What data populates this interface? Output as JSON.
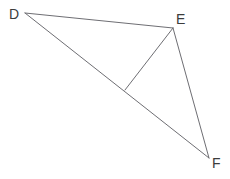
{
  "figure": {
    "background_color": "#ffffff",
    "width": 230,
    "height": 179,
    "stroke_color": "#6e6e73",
    "stroke_width": 1,
    "label_color": "#3c3c3c",
    "vertices": [
      {
        "id": "D",
        "label": "D",
        "x": 25,
        "y": 13,
        "label_x": 9,
        "label_y": 7
      },
      {
        "id": "E",
        "label": "E",
        "x": 173,
        "y": 28,
        "label_x": 176,
        "label_y": 12
      },
      {
        "id": "F",
        "label": "F",
        "x": 209,
        "y": 158,
        "label_x": 212,
        "label_y": 156
      }
    ],
    "interior_point": {
      "id": "G",
      "label": "",
      "x": 125,
      "y": 90
    },
    "segments": [
      {
        "id": "DE",
        "from": "D",
        "to": "E",
        "x1": 25,
        "y1": 13,
        "x2": 173,
        "y2": 28
      },
      {
        "id": "DF",
        "from": "D",
        "to": "F",
        "x1": 25,
        "y1": 13,
        "x2": 209,
        "y2": 158
      },
      {
        "id": "EF",
        "from": "E",
        "to": "F",
        "x1": 173,
        "y1": 28,
        "x2": 209,
        "y2": 158
      },
      {
        "id": "EG",
        "from": "E",
        "to": "G",
        "x1": 173,
        "y1": 28,
        "x2": 125,
        "y2": 90
      }
    ]
  }
}
